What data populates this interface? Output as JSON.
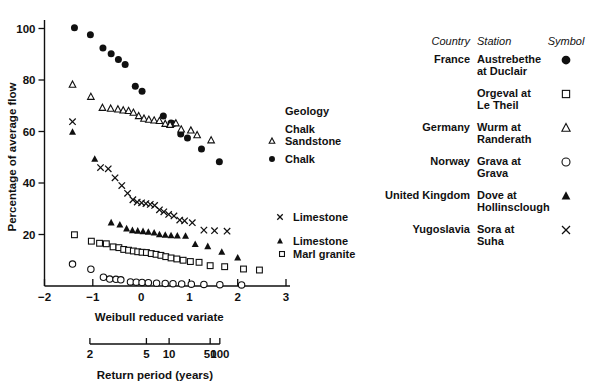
{
  "chart_data": {
    "type": "scatter",
    "title": "",
    "xlabel": "Weibull reduced variate",
    "ylabel": "Percentage of average flow",
    "xlim": [
      -2,
      3
    ],
    "ylim": [
      0,
      105
    ],
    "xticks": [
      -2,
      -1,
      0,
      1,
      2,
      3
    ],
    "xtick_labels": [
      "−2",
      "−1",
      "0",
      "1",
      "2",
      "3"
    ],
    "yticks": [
      20,
      40,
      60,
      80,
      100
    ],
    "ytick_labels": [
      "20",
      "40",
      "60",
      "80",
      "100"
    ],
    "grid": false,
    "legend_position": "right",
    "secondary_axis": {
      "label": "Return period (years)",
      "ticks": [
        2,
        5,
        10,
        50,
        100
      ],
      "tick_labels": [
        "2",
        "5",
        "10",
        "50",
        "100"
      ],
      "tick_x_values": [
        -1.06,
        0.11,
        0.58,
        1.43,
        1.63
      ]
    },
    "series": [
      {
        "name": "Austrebethe at Duclair",
        "country": "France",
        "symbol": "filled-circle",
        "geology": "Chalk",
        "points": [
          [
            -1.38,
            100.3
          ],
          [
            -1.05,
            97.6
          ],
          [
            -0.79,
            92.4
          ],
          [
            -0.62,
            90.2
          ],
          [
            -0.47,
            88.0
          ],
          [
            -0.33,
            86.0
          ],
          [
            -0.12,
            77.6
          ],
          [
            0.02,
            75.6
          ],
          [
            0.46,
            66.0
          ],
          [
            0.62,
            63.3
          ],
          [
            0.66,
            63.0
          ],
          [
            0.82,
            59.0
          ],
          [
            0.96,
            57.5
          ],
          [
            1.25,
            53.2
          ],
          [
            1.62,
            48.3
          ]
        ]
      },
      {
        "name": "Orgeval at Le Theil",
        "country": "France",
        "symbol": "open-square",
        "geology": "Marl granite",
        "points": [
          [
            -1.38,
            19.9
          ],
          [
            -1.03,
            17.4
          ],
          [
            -0.86,
            16.6
          ],
          [
            -0.72,
            16.4
          ],
          [
            -0.58,
            15.2
          ],
          [
            -0.46,
            14.9
          ],
          [
            -0.36,
            14.2
          ],
          [
            -0.26,
            13.9
          ],
          [
            -0.16,
            13.6
          ],
          [
            -0.07,
            13.3
          ],
          [
            0.02,
            13.1
          ],
          [
            0.11,
            13.0
          ],
          [
            0.21,
            12.6
          ],
          [
            0.31,
            12.3
          ],
          [
            0.41,
            11.9
          ],
          [
            0.51,
            11.4
          ],
          [
            0.62,
            10.9
          ],
          [
            0.74,
            10.5
          ],
          [
            0.87,
            10.0
          ],
          [
            1.02,
            9.5
          ],
          [
            1.2,
            9.2
          ],
          [
            1.43,
            7.9
          ],
          [
            1.73,
            7.5
          ],
          [
            2.12,
            6.6
          ],
          [
            2.45,
            6.2
          ]
        ]
      },
      {
        "name": "Wurm at Randerath",
        "country": "Germany",
        "symbol": "open-triangle",
        "geology": "Chalk Sandstone",
        "points": [
          [
            -1.42,
            78.2
          ],
          [
            -1.04,
            73.5
          ],
          [
            -0.8,
            69.2
          ],
          [
            -0.63,
            68.9
          ],
          [
            -0.48,
            68.6
          ],
          [
            -0.37,
            68.2
          ],
          [
            -0.26,
            68.0
          ],
          [
            -0.16,
            67.3
          ],
          [
            -0.05,
            66.0
          ],
          [
            0.06,
            65.0
          ],
          [
            0.16,
            64.6
          ],
          [
            0.27,
            64.3
          ],
          [
            0.38,
            64.1
          ],
          [
            0.5,
            63.0
          ],
          [
            0.6,
            62.6
          ],
          [
            0.72,
            63.2
          ],
          [
            0.83,
            60.8
          ],
          [
            1.03,
            60.4
          ],
          [
            1.16,
            58.6
          ],
          [
            1.45,
            56.6
          ]
        ]
      },
      {
        "name": "Grava at Grava",
        "country": "Norway",
        "symbol": "open-circle",
        "geology": "",
        "points": [
          [
            -1.42,
            8.5
          ],
          [
            -1.04,
            6.5
          ],
          [
            -0.78,
            3.4
          ],
          [
            -0.65,
            2.7
          ],
          [
            -0.52,
            2.6
          ],
          [
            -0.42,
            2.4
          ],
          [
            -0.22,
            1.6
          ],
          [
            -0.1,
            1.5
          ],
          [
            0.02,
            1.4
          ],
          [
            0.15,
            1.3
          ],
          [
            0.32,
            1.1
          ],
          [
            0.5,
            1.0
          ],
          [
            0.66,
            0.9
          ],
          [
            0.84,
            0.8
          ],
          [
            1.04,
            0.7
          ],
          [
            1.3,
            0.6
          ],
          [
            1.63,
            0.5
          ],
          [
            2.08,
            0.4
          ]
        ]
      },
      {
        "name": "Dove at Hollinsclough",
        "country": "United Kingdom",
        "symbol": "filled-triangle",
        "geology": "Limestone",
        "points": [
          [
            -1.42,
            59.8
          ],
          [
            -0.96,
            49.3
          ],
          [
            -0.62,
            24.6
          ],
          [
            -0.44,
            23.8
          ],
          [
            -0.3,
            22.3
          ],
          [
            -0.18,
            21.6
          ],
          [
            -0.07,
            21.4
          ],
          [
            0.04,
            21.2
          ],
          [
            0.15,
            21.0
          ],
          [
            0.27,
            20.7
          ],
          [
            0.38,
            20.0
          ],
          [
            0.5,
            19.8
          ],
          [
            0.62,
            19.6
          ],
          [
            0.75,
            19.5
          ],
          [
            0.92,
            19.4
          ],
          [
            1.12,
            16.2
          ],
          [
            1.38,
            15.4
          ],
          [
            1.67,
            13.2
          ],
          [
            2.0,
            11.0
          ]
        ]
      },
      {
        "name": "Sora at Suha",
        "country": "Yugoslavia",
        "symbol": "x-mark",
        "geology": "Limestone",
        "points": [
          [
            -1.42,
            63.8
          ],
          [
            -0.84,
            46.0
          ],
          [
            -0.68,
            45.5
          ],
          [
            -0.54,
            42.0
          ],
          [
            -0.4,
            39.0
          ],
          [
            -0.28,
            36.0
          ],
          [
            -0.17,
            33.5
          ],
          [
            -0.08,
            32.6
          ],
          [
            0.01,
            32.3
          ],
          [
            0.1,
            32.0
          ],
          [
            0.19,
            31.7
          ],
          [
            0.28,
            31.3
          ],
          [
            0.38,
            29.6
          ],
          [
            0.47,
            28.8
          ],
          [
            0.57,
            27.8
          ],
          [
            0.68,
            27.2
          ],
          [
            0.8,
            25.6
          ],
          [
            0.9,
            25.3
          ],
          [
            1.06,
            24.6
          ],
          [
            1.3,
            21.7
          ],
          [
            1.52,
            21.5
          ],
          [
            1.78,
            21.3
          ]
        ]
      }
    ],
    "annotations": [
      {
        "text": "Geology",
        "marker": "none"
      },
      {
        "text": "Chalk",
        "marker": "none"
      },
      {
        "text": "Sandstone",
        "marker": "open-triangle"
      },
      {
        "text": "Chalk",
        "marker": "filled-circle"
      },
      {
        "text": "Limestone",
        "marker": "x-mark"
      },
      {
        "text": "Limestone",
        "marker": "filled-triangle"
      },
      {
        "text": "Marl granite",
        "marker": "open-square"
      }
    ]
  },
  "legend_table": {
    "headers": {
      "country": "Country",
      "station": "Station",
      "symbol": "Symbol"
    },
    "rows": [
      {
        "country": "France",
        "station_line1": "Austrebethe",
        "station_line2": "at Duclair",
        "symbol": "filled-circle"
      },
      {
        "country": "",
        "station_line1": "Orgeval at",
        "station_line2": "Le Theil",
        "symbol": "open-square"
      },
      {
        "country": "Germany",
        "station_line1": "Wurm at",
        "station_line2": "Randerath",
        "symbol": "open-triangle"
      },
      {
        "country": "Norway",
        "station_line1": "Grava at",
        "station_line2": "Grava",
        "symbol": "open-circle"
      },
      {
        "country": "United Kingdom",
        "station_line1": "Dove at",
        "station_line2": "Hollinsclough",
        "symbol": "filled-triangle"
      },
      {
        "country": "Yugoslavia",
        "station_line1": "Sora at",
        "station_line2": "Suha",
        "symbol": "x-mark"
      }
    ]
  }
}
